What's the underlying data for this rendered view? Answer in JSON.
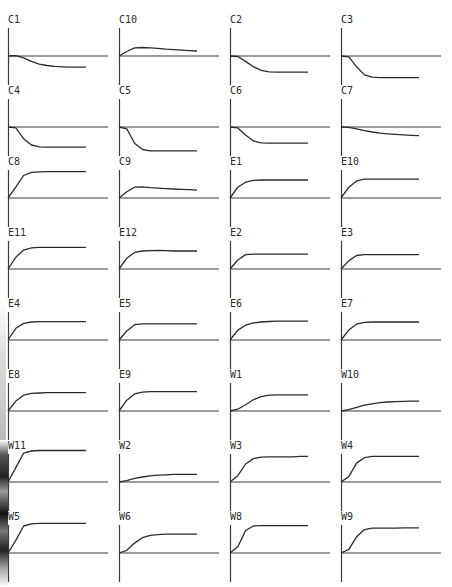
{
  "chart_data": {
    "type": "line",
    "title": "",
    "layout": {
      "rows": 8,
      "columns": 4,
      "grid": false,
      "legend": "none",
      "note": "small-multiples of response curves; each panel has y-axis and horizontal zero baseline; values normalized to baseline=0"
    },
    "x": [
      0,
      0.1,
      0.2,
      0.3,
      0.4,
      0.5,
      0.6,
      0.7,
      0.8,
      0.9,
      1.0
    ],
    "series": [
      {
        "name": "C1",
        "values": [
          0,
          0.02,
          -0.1,
          -0.3,
          -0.45,
          -0.53,
          -0.58,
          -0.6,
          -0.62,
          -0.62,
          -0.62
        ]
      },
      {
        "name": "C10",
        "values": [
          0,
          0.25,
          0.45,
          0.47,
          0.45,
          0.42,
          0.38,
          0.35,
          0.32,
          0.3,
          0.28
        ]
      },
      {
        "name": "C2",
        "values": [
          0,
          -0.03,
          -0.3,
          -0.6,
          -0.8,
          -0.88,
          -0.9,
          -0.9,
          -0.9,
          -0.9,
          -0.9
        ]
      },
      {
        "name": "C3",
        "values": [
          0,
          -0.05,
          -0.6,
          -1.05,
          -1.18,
          -1.2,
          -1.2,
          -1.2,
          -1.2,
          -1.2,
          -1.2
        ]
      },
      {
        "name": "C4",
        "values": [
          0,
          -0.05,
          -0.65,
          -1.0,
          -1.1,
          -1.12,
          -1.12,
          -1.12,
          -1.12,
          -1.12,
          -1.12
        ]
      },
      {
        "name": "C5",
        "values": [
          0,
          -0.1,
          -0.9,
          -1.25,
          -1.32,
          -1.33,
          -1.33,
          -1.33,
          -1.33,
          -1.33,
          -1.33
        ]
      },
      {
        "name": "C6",
        "values": [
          0,
          -0.05,
          -0.45,
          -0.78,
          -0.88,
          -0.9,
          -0.9,
          -0.9,
          -0.9,
          -0.9,
          -0.9
        ]
      },
      {
        "name": "C7",
        "values": [
          0,
          -0.02,
          -0.1,
          -0.2,
          -0.28,
          -0.34,
          -0.38,
          -0.41,
          -0.44,
          -0.46,
          -0.48
        ]
      },
      {
        "name": "C8",
        "values": [
          0,
          0.6,
          1.25,
          1.42,
          1.45,
          1.46,
          1.46,
          1.46,
          1.46,
          1.46,
          1.46
        ]
      },
      {
        "name": "C9",
        "values": [
          0,
          0.35,
          0.6,
          0.62,
          0.58,
          0.55,
          0.52,
          0.5,
          0.48,
          0.46,
          0.44
        ]
      },
      {
        "name": "E1",
        "values": [
          0,
          0.6,
          0.88,
          0.98,
          1.0,
          1.0,
          1.0,
          1.0,
          1.0,
          1.0,
          1.0
        ]
      },
      {
        "name": "E10",
        "values": [
          0,
          0.6,
          0.95,
          1.05,
          1.05,
          1.05,
          1.05,
          1.05,
          1.05,
          1.05,
          1.05
        ]
      },
      {
        "name": "E11",
        "values": [
          0,
          0.65,
          1.05,
          1.18,
          1.2,
          1.2,
          1.2,
          1.2,
          1.2,
          1.2,
          1.2
        ]
      },
      {
        "name": "E12",
        "values": [
          0,
          0.6,
          0.92,
          1.0,
          1.02,
          1.03,
          1.02,
          1.0,
          1.0,
          1.0,
          1.0
        ]
      },
      {
        "name": "E2",
        "values": [
          0,
          0.5,
          0.8,
          0.82,
          0.82,
          0.82,
          0.82,
          0.82,
          0.82,
          0.82,
          0.82
        ]
      },
      {
        "name": "E3",
        "values": [
          0,
          0.45,
          0.75,
          0.8,
          0.8,
          0.8,
          0.8,
          0.8,
          0.8,
          0.8,
          0.8
        ]
      },
      {
        "name": "E4",
        "values": [
          0,
          0.65,
          0.92,
          1.0,
          1.02,
          1.02,
          1.02,
          1.02,
          1.02,
          1.02,
          1.02
        ]
      },
      {
        "name": "E5",
        "values": [
          0,
          0.5,
          0.85,
          0.9,
          0.9,
          0.9,
          0.9,
          0.9,
          0.9,
          0.9,
          0.9
        ]
      },
      {
        "name": "E6",
        "values": [
          0,
          0.55,
          0.82,
          0.95,
          1.0,
          1.03,
          1.05,
          1.05,
          1.05,
          1.05,
          1.05
        ]
      },
      {
        "name": "E7",
        "values": [
          0,
          0.55,
          0.88,
          0.98,
          1.0,
          1.0,
          1.0,
          1.0,
          1.0,
          1.0,
          1.0
        ]
      },
      {
        "name": "E8",
        "values": [
          0,
          0.55,
          0.88,
          0.98,
          1.0,
          1.02,
          1.02,
          1.02,
          1.02,
          1.02,
          1.02
        ]
      },
      {
        "name": "E9",
        "values": [
          0,
          0.6,
          0.95,
          1.05,
          1.08,
          1.08,
          1.08,
          1.08,
          1.08,
          1.08,
          1.08
        ]
      },
      {
        "name": "W1",
        "values": [
          0,
          0.1,
          0.35,
          0.62,
          0.8,
          0.88,
          0.9,
          0.9,
          0.9,
          0.9,
          0.9
        ]
      },
      {
        "name": "W10",
        "values": [
          0,
          0.08,
          0.2,
          0.32,
          0.4,
          0.46,
          0.5,
          0.52,
          0.54,
          0.55,
          0.55
        ]
      },
      {
        "name": "W11",
        "values": [
          0,
          0.8,
          1.6,
          1.72,
          1.75,
          1.75,
          1.75,
          1.75,
          1.75,
          1.75,
          1.75
        ]
      },
      {
        "name": "W2",
        "values": [
          0,
          0.08,
          0.2,
          0.28,
          0.34,
          0.38,
          0.4,
          0.42,
          0.42,
          0.42,
          0.42
        ]
      },
      {
        "name": "W3",
        "values": [
          0,
          0.35,
          1.0,
          1.3,
          1.38,
          1.4,
          1.4,
          1.4,
          1.4,
          1.42,
          1.42
        ]
      },
      {
        "name": "W4",
        "values": [
          0,
          0.3,
          1.05,
          1.35,
          1.42,
          1.42,
          1.42,
          1.42,
          1.42,
          1.42,
          1.42
        ]
      },
      {
        "name": "W5",
        "values": [
          0,
          0.7,
          1.5,
          1.62,
          1.65,
          1.65,
          1.65,
          1.65,
          1.65,
          1.65,
          1.65
        ]
      },
      {
        "name": "W6",
        "values": [
          0,
          0.15,
          0.55,
          0.85,
          0.98,
          1.02,
          1.05,
          1.05,
          1.05,
          1.05,
          1.05
        ]
      },
      {
        "name": "W8",
        "values": [
          0,
          0.35,
          1.25,
          1.5,
          1.52,
          1.52,
          1.52,
          1.52,
          1.52,
          1.52,
          1.52
        ]
      },
      {
        "name": "W9",
        "values": [
          0,
          0.2,
          0.9,
          1.3,
          1.38,
          1.38,
          1.38,
          1.38,
          1.4,
          1.4,
          1.4
        ]
      }
    ],
    "xlabel": "",
    "ylabel": "",
    "ylim": [
      -1.6,
      2.0
    ]
  },
  "style": {
    "line_color": "#2b2b2b",
    "axis_color": "#3a3a3a",
    "background": "#ffffff"
  }
}
